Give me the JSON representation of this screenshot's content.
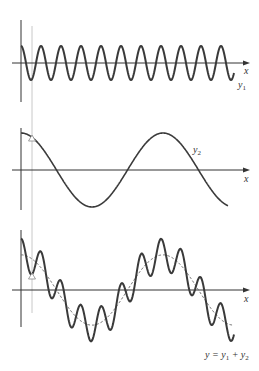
{
  "figure": {
    "panels": [
      {
        "id": "y1",
        "axis_label": "x",
        "curve_label": "y",
        "curve_sub": "1",
        "description": "high-frequency cosine wave"
      },
      {
        "id": "y2",
        "axis_label": "x",
        "curve_label": "y",
        "curve_sub": "2",
        "description": "low-frequency cosine wave"
      },
      {
        "id": "sum",
        "axis_label": "x",
        "curve_label_parts": [
          "y = y",
          "1",
          " + y",
          "2"
        ],
        "description": "superposition of y1 and y2, with y2 shown dashed"
      }
    ],
    "colors": {
      "curve": "#3a3a3a",
      "axis": "#333333",
      "guide": "#c8c8c8",
      "dashed": "#666666"
    }
  },
  "chart_data": {
    "type": "line",
    "title": "",
    "xlabel": "x",
    "series": [
      {
        "name": "y1",
        "amplitude": 17,
        "period_px": 20,
        "phase": "cosine (max at x=0)",
        "x_range_px": [
          21,
          234
        ]
      },
      {
        "name": "y2",
        "amplitude": 37,
        "period_px": 142,
        "phase": "cosine (max at x=0)",
        "x_range_px": [
          21,
          228
        ]
      },
      {
        "name": "y = y1 + y2",
        "components": [
          "y1",
          "y2"
        ],
        "x_range_px": [
          21,
          234
        ]
      }
    ],
    "annotations": [
      "vertical guide line near x=0 with triangle markers on panels 2 and 3"
    ],
    "grid": false
  }
}
